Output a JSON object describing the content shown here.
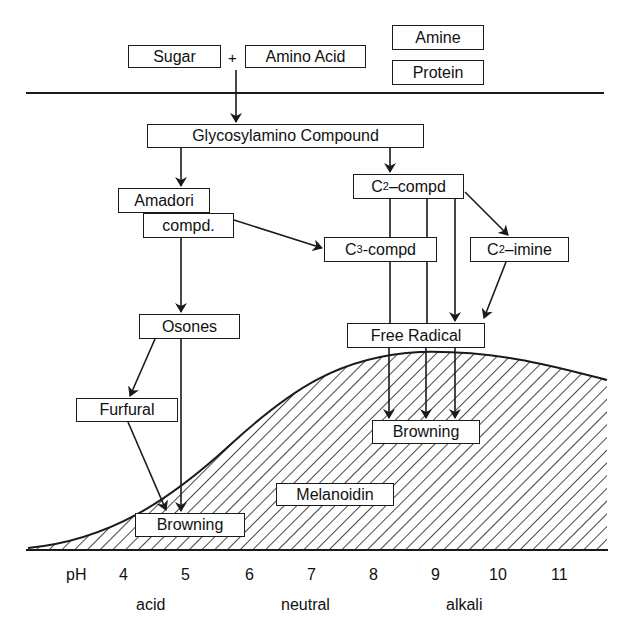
{
  "reactants": {
    "sugar": "Sugar",
    "plus": "+",
    "amino_acid": "Amino Acid",
    "amine": "Amine",
    "protein": "Protein"
  },
  "nodes": {
    "glycosylamino": "Glycosylamino Compound",
    "amadori_line1": "Amadori",
    "amadori_line2": "compd.",
    "c2_compd": {
      "prefix": "C",
      "sub": "2",
      "suffix": "–compd"
    },
    "c3_compd": {
      "prefix": "C",
      "sub": "3",
      "suffix": "-compd"
    },
    "c2_imine": {
      "prefix": "C",
      "sub": "2",
      "suffix": "–imine"
    },
    "osones": "Osones",
    "furfural": "Furfural",
    "free_radical": "Free Radical",
    "browning_left": "Browning",
    "browning_right": "Browning",
    "melanoidin": "Melanoidin"
  },
  "axis": {
    "label": "pH",
    "ticks": [
      "4",
      "5",
      "6",
      "7",
      "8",
      "9",
      "10",
      "11"
    ],
    "regions": [
      "acid",
      "neutral",
      "alkali"
    ]
  },
  "colors": {
    "ink": "#1a1a1a",
    "background": "#ffffff"
  }
}
